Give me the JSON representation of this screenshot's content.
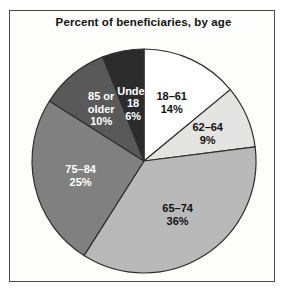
{
  "figure": {
    "title": "Percent of beneficiaries, by age",
    "border_color": "#4a4a4a",
    "background_color": "#fdfdfb"
  },
  "chart_data": {
    "type": "pie",
    "title": "Percent of beneficiaries, by age",
    "xlabel": "",
    "ylabel": "",
    "unit": "percent",
    "start_angle_deg": 0,
    "direction": "clockwise",
    "legend": "none (labels drawn on slices)",
    "grid": false,
    "categories": [
      "18–61",
      "62–64",
      "65–74",
      "75–84",
      "85 or older",
      "Under 18"
    ],
    "values": [
      14,
      9,
      36,
      25,
      10,
      6
    ],
    "total": 100,
    "slices": [
      {
        "label": "18–61",
        "value": 14,
        "value_text": "14%",
        "color": "#ffffff",
        "text_color": "#111111",
        "label_lines": [
          "18–61",
          "14%"
        ]
      },
      {
        "label": "62–64",
        "value": 9,
        "value_text": "9%",
        "color": "#e4e4e2",
        "text_color": "#111111",
        "label_lines": [
          "62–64",
          "9%"
        ]
      },
      {
        "label": "65–74",
        "value": 36,
        "value_text": "36%",
        "color": "#b9b9b9",
        "text_color": "#111111",
        "label_lines": [
          "65–74",
          "36%"
        ]
      },
      {
        "label": "75–84",
        "value": 25,
        "value_text": "25%",
        "color": "#808080",
        "text_color": "#ffffff",
        "label_lines": [
          "75–84",
          "25%"
        ]
      },
      {
        "label": "85 or older",
        "value": 10,
        "value_text": "10%",
        "color": "#595959",
        "text_color": "#ffffff",
        "label_lines": [
          "85 or",
          "older",
          "10%"
        ]
      },
      {
        "label": "Under 18",
        "value": 6,
        "value_text": "6%",
        "color": "#2b2b2b",
        "text_color": "#ffffff",
        "label_lines": [
          "Under",
          "18",
          "6%"
        ]
      }
    ]
  }
}
